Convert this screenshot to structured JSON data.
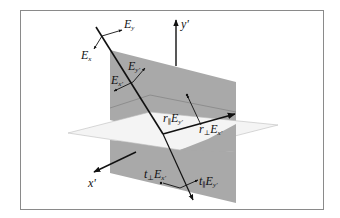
{
  "figure": {
    "colors": {
      "frame": "#8a8a8a",
      "plane_of_incidence": "#a9a9a9",
      "interface_plane": "#f4f4f4",
      "lines": "#111111"
    },
    "axes": {
      "y_prime": {
        "base": "y",
        "prime": "'"
      },
      "x_prime": {
        "base": "x",
        "prime": "'"
      }
    },
    "labels": {
      "incident_ex": {
        "coef": "",
        "sub": "",
        "field": "E",
        "field_sub": "x"
      },
      "incident_ey": {
        "coef": "",
        "sub": "",
        "field": "E",
        "field_sub": "y"
      },
      "incident_exp": {
        "coef": "",
        "sub": "",
        "field": "E",
        "field_sub": "x'"
      },
      "incident_eyp": {
        "coef": "",
        "sub": "",
        "field": "E",
        "field_sub": "y'"
      },
      "reflected_par": {
        "coef": "r",
        "sub": "∥",
        "field": "E",
        "field_sub": "y'"
      },
      "reflected_perp": {
        "coef": "r",
        "sub": "⊥",
        "field": "E",
        "field_sub": "x'"
      },
      "transmitted_perp": {
        "coef": "t",
        "sub": "⊥",
        "field": "E",
        "field_sub": "x'"
      },
      "transmitted_par": {
        "coef": "t",
        "sub": "∥",
        "field": "E",
        "field_sub": "y'"
      }
    }
  }
}
